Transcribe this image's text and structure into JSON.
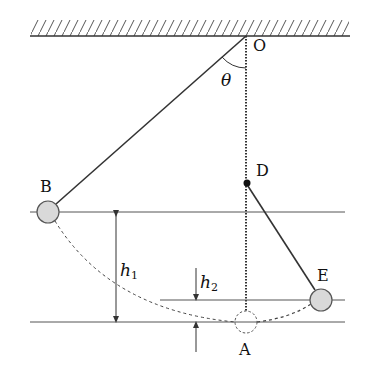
{
  "diagram": {
    "type": "physics-pendulum",
    "labels": {
      "pivot": "O",
      "angle": "θ",
      "peg": "D",
      "left_position": "B",
      "right_position": "E",
      "lowest_position": "A",
      "height1": "h",
      "height1_sub": "1",
      "height2": "h",
      "height2_sub": "2"
    },
    "colors": {
      "line": "#333333",
      "ball_fill": "#d9d9d9",
      "ball_stroke": "#555555",
      "background": "#ffffff"
    }
  }
}
